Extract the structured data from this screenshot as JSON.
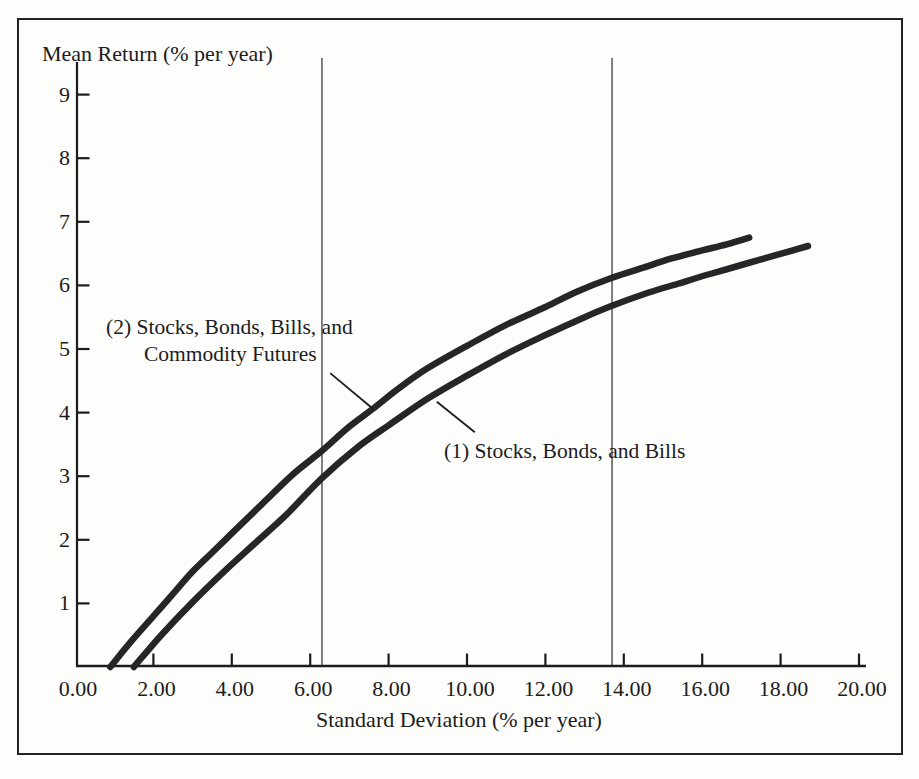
{
  "figure": {
    "background": "#fdfdfc",
    "ink_color": "#1c1c1c",
    "curve_color": "#262626",
    "reference_line_color": "#4a4a4a"
  },
  "chart_data": {
    "type": "line",
    "title": "",
    "xlabel": "Standard Deviation (% per year)",
    "ylabel": "Mean Return (% per year)",
    "xlim": [
      0,
      20.4
    ],
    "ylim": [
      0,
      9.6
    ],
    "grid": "two vertical reference lines only",
    "legend_position": "inline annotations with leader lines",
    "x_ticks": [
      {
        "value": 0,
        "label": "0.00"
      },
      {
        "value": 2,
        "label": "2.00"
      },
      {
        "value": 4,
        "label": "4.00"
      },
      {
        "value": 6,
        "label": "6.00"
      },
      {
        "value": 8,
        "label": "8.00"
      },
      {
        "value": 10,
        "label": "10.00"
      },
      {
        "value": 12,
        "label": "12.00"
      },
      {
        "value": 14,
        "label": "14.00"
      },
      {
        "value": 16,
        "label": "16.00"
      },
      {
        "value": 18,
        "label": "18.00"
      },
      {
        "value": 20,
        "label": "20.00"
      }
    ],
    "y_ticks": [
      {
        "value": 1,
        "label": "1"
      },
      {
        "value": 2,
        "label": "2"
      },
      {
        "value": 3,
        "label": "3"
      },
      {
        "value": 4,
        "label": "4"
      },
      {
        "value": 5,
        "label": "5"
      },
      {
        "value": 6,
        "label": "6"
      },
      {
        "value": 7,
        "label": "7"
      },
      {
        "value": 8,
        "label": "8"
      },
      {
        "value": 9,
        "label": "9"
      }
    ],
    "reference_lines_x": [
      6.3,
      13.7
    ],
    "series": [
      {
        "name": "(2) Stocks, Bonds, Bills, and Commodity Futures",
        "points": [
          [
            0.9,
            0
          ],
          [
            1.4,
            0.38
          ],
          [
            2,
            0.8
          ],
          [
            2.5,
            1.15
          ],
          [
            3,
            1.5
          ],
          [
            3.5,
            1.8
          ],
          [
            4,
            2.1
          ],
          [
            4.5,
            2.4
          ],
          [
            5,
            2.7
          ],
          [
            5.6,
            3.05
          ],
          [
            6.3,
            3.4
          ],
          [
            7,
            3.78
          ],
          [
            7.6,
            4.06
          ],
          [
            8.3,
            4.4
          ],
          [
            9,
            4.7
          ],
          [
            10,
            5.05
          ],
          [
            11,
            5.38
          ],
          [
            12,
            5.66
          ],
          [
            12.8,
            5.9
          ],
          [
            13.7,
            6.12
          ],
          [
            14.5,
            6.28
          ],
          [
            15.2,
            6.42
          ],
          [
            16,
            6.55
          ],
          [
            16.6,
            6.64
          ],
          [
            17.2,
            6.75
          ]
        ]
      },
      {
        "name": "(1) Stocks, Bonds, and Bills",
        "points": [
          [
            1.5,
            0
          ],
          [
            2.2,
            0.5
          ],
          [
            3,
            1.02
          ],
          [
            3.8,
            1.5
          ],
          [
            4.6,
            1.95
          ],
          [
            5.4,
            2.4
          ],
          [
            6.3,
            2.97
          ],
          [
            7.2,
            3.45
          ],
          [
            8,
            3.8
          ],
          [
            9,
            4.22
          ],
          [
            10,
            4.58
          ],
          [
            11,
            4.92
          ],
          [
            12,
            5.22
          ],
          [
            13,
            5.5
          ],
          [
            13.7,
            5.68
          ],
          [
            14.6,
            5.88
          ],
          [
            15.4,
            6.03
          ],
          [
            16.2,
            6.18
          ],
          [
            17,
            6.32
          ],
          [
            17.9,
            6.48
          ],
          [
            18.7,
            6.62
          ]
        ]
      }
    ],
    "annotations": [
      {
        "id": "series-2-label",
        "lines": [
          "(2)  Stocks, Bonds, Bills, and",
          "Commodity Futures"
        ],
        "leader": [
          [
            6.51,
            4.62
          ],
          [
            7.6,
            4.06
          ]
        ]
      },
      {
        "id": "series-1-label",
        "lines": [
          "(1)  Stocks, Bonds, and Bills"
        ],
        "leader": [
          [
            9.23,
            4.17
          ],
          [
            10.2,
            3.69
          ]
        ]
      }
    ]
  }
}
